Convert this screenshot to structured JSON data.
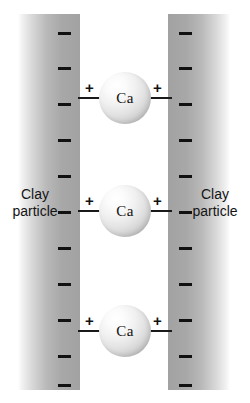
{
  "diagram": {
    "background_color": "#ffffff"
  },
  "slabs": {
    "left": {
      "label_line1": "Clay",
      "label_line2": "particle",
      "charge_symbol": "–",
      "charge_count": 11
    },
    "right": {
      "label_line1": "Clay",
      "label_line2": "particle",
      "charge_symbol": "–",
      "charge_count": 11
    }
  },
  "negative_charges": {
    "symbol": "–",
    "left_y": [
      32,
      67,
      103,
      139,
      175,
      211,
      247,
      283,
      319,
      355,
      384
    ],
    "right_y": [
      32,
      67,
      103,
      139,
      175,
      211,
      247,
      283,
      319,
      355,
      384
    ],
    "color": "#111111"
  },
  "ions": [
    {
      "label": "Ca",
      "center_y": 98,
      "left_charge": "+",
      "right_charge": "+"
    },
    {
      "label": "Ca",
      "center_y": 211,
      "left_charge": "+",
      "right_charge": "+"
    },
    {
      "label": "Ca",
      "center_y": 331,
      "left_charge": "+",
      "right_charge": "+"
    }
  ],
  "colors": {
    "ink": "#111111",
    "slab_dark": "#a2a2a2",
    "slab_light": "#ffffff",
    "sphere_highlight": "#ffffff",
    "sphere_shadow": "#a6a6a6"
  }
}
